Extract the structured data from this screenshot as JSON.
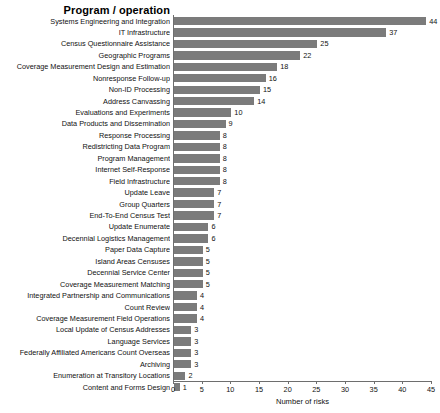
{
  "chart_data": {
    "type": "bar",
    "orientation": "horizontal",
    "title": "Program / operation",
    "xlabel": "Number of risks",
    "ylabel": "",
    "xlim": [
      0,
      45
    ],
    "xticks": [
      0,
      5,
      10,
      15,
      20,
      25,
      30,
      35,
      40,
      45
    ],
    "grid": false,
    "legend": false,
    "bar_color": "#7b7b7b",
    "axis_color": "#6e6e6e",
    "categories": [
      "Systems Engineering and Integration",
      "IT Infrastructure",
      "Census Questionnaire Assistance",
      "Geographic Programs",
      "Coverage Measurement Design and Estimation",
      "Nonresponse Follow-up",
      "Non-ID Processing",
      "Address Canvassing",
      "Evaluations and Experiments",
      "Data Products and Dissemination",
      "Response Processing",
      "Redistricting Data Program",
      "Program Management",
      "Internet Self-Response",
      "Field Infrastructure",
      "Update Leave",
      "Group Quarters",
      "End-To-End Census Test",
      "Update Enumerate",
      "Decennial Logistics Management",
      "Paper Data Capture",
      "Island Areas Censuses",
      "Decennial Service Center",
      "Coverage Measurement Matching",
      "Integrated Partnership and Communications",
      "Count Review",
      "Coverage Measurement Field Operations",
      "Local Update of Census Addresses",
      "Language Services",
      "Federally Affiliated Americans Count Overseas",
      "Archiving",
      "Enumeration at Transitory Locations",
      "Content and Forms Design"
    ],
    "values": [
      44,
      37,
      25,
      22,
      18,
      16,
      15,
      14,
      10,
      9,
      8,
      8,
      8,
      8,
      8,
      7,
      7,
      7,
      6,
      6,
      5,
      5,
      5,
      5,
      4,
      4,
      4,
      3,
      3,
      3,
      3,
      2,
      1
    ]
  }
}
